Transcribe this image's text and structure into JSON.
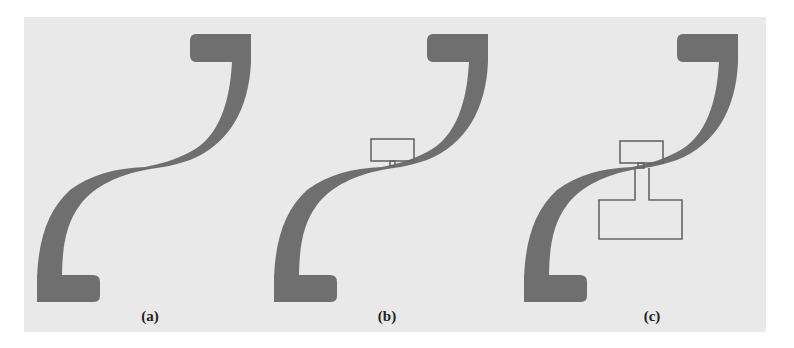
{
  "figure": {
    "background_color": "#e9e9e9",
    "trace_color": "#6f6f6f",
    "outline_color": "#666666",
    "panels": [
      {
        "id": "a",
        "label": "(a)",
        "label_x": 150,
        "description": "S-shaped tapered microstrip line with end pads"
      },
      {
        "id": "b",
        "label": "(b)",
        "label_x": 387,
        "description": "S-shaped line with small rectangular stub loaded at center"
      },
      {
        "id": "c",
        "label": "(c)",
        "label_x": 652,
        "description": "S-shaped line with small stub and large T-shaped stub loaded at center"
      }
    ]
  }
}
